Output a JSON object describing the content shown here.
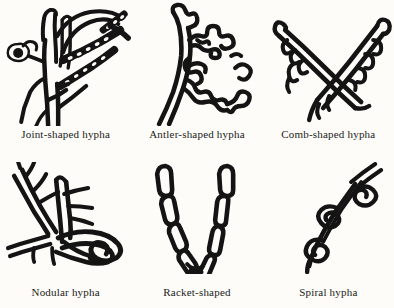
{
  "figure": {
    "background_color": "#fdfcf8",
    "ink_color": "#141414",
    "columns": 3,
    "rows": 2
  },
  "panels": [
    {
      "id": "joint-shaped-hypha",
      "label": "Joint-shaped hypha",
      "row": 1,
      "column": 1,
      "description": "Branching septate hyphae bearing chains of rectangular arthroconidia"
    },
    {
      "id": "antler-shaped-hypha",
      "label": "Antler-shaped hypha",
      "row": 1,
      "column": 2,
      "description": "Main filament with swollen irregular branches resembling deer antlers"
    },
    {
      "id": "comb-shaped-hypha",
      "label": "Comb-shaped hypha",
      "row": 1,
      "column": 3,
      "description": "Crossed filaments bearing short unilateral comb-like projections"
    },
    {
      "id": "nodular-hypha",
      "label": "Nodular hypha",
      "row": 2,
      "column": 1,
      "description": "Branching hyphae terminating in an intertwined knotted nodular body"
    },
    {
      "id": "racket-shaped-hypha",
      "label": "Racket-shaped",
      "row": 2,
      "column": 2,
      "description": "V-shaped chain of club or racket shaped swollen hyphal segments"
    },
    {
      "id": "spiral-hypha",
      "label": "Spiral hypha",
      "row": 2,
      "column": 3,
      "description": "Filament coiled into successive spiral turns with a forked tip"
    }
  ]
}
